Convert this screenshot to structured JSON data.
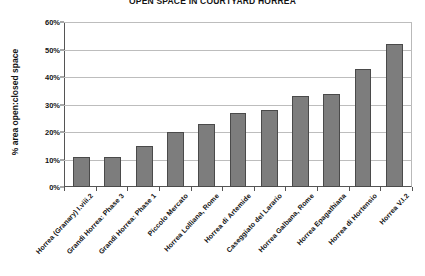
{
  "chart_data": {
    "type": "bar",
    "title": "OPEN SPACE IN COURTYARD HORREA",
    "xlabel": "",
    "ylabel": "% area open:closed space",
    "ylim": [
      0,
      60
    ],
    "ytick_labels": [
      "0%",
      "10%",
      "20%",
      "30%",
      "40%",
      "50%",
      "60%"
    ],
    "ytick_values": [
      0,
      10,
      20,
      30,
      40,
      50,
      60
    ],
    "grid": true,
    "legend": "none",
    "series_color": "#7d7d7d",
    "categories": [
      "Horrea (Granary) I.viii.2",
      "Grandi Horrea: Phase 3",
      "Grandi Horrea: Phase 1",
      "Piccolo Mercato",
      "Horrea Lolliana, Rome",
      "Horrea di Artemide",
      "Caseggiato del Larario",
      "Horrea Galbana, Rome",
      "Horrea Epagathiana",
      "Horrea di Hortensio",
      "Horrea V.I.2"
    ],
    "values": [
      11,
      11,
      15,
      20,
      23,
      27,
      28,
      33,
      34,
      43,
      52
    ],
    "value_labels": [
      "11%",
      "11%",
      "15%",
      "20%",
      "23%",
      "27%",
      "28%",
      "33%",
      "34%",
      "43%",
      "52%"
    ]
  }
}
